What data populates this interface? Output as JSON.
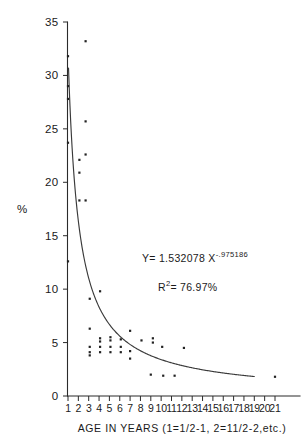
{
  "chart_data": {
    "type": "scatter",
    "title": "",
    "subtitle": "",
    "xlabel": "AGE IN YEARS (1=1/2-1, 2=11/2-2,etc.)",
    "ylabel": "%",
    "xlim": [
      0,
      21.8
    ],
    "ylim": [
      0,
      35
    ],
    "grid": false,
    "legend": false,
    "x_ticks": [
      1,
      2,
      3,
      4,
      5,
      6,
      7,
      8,
      9,
      10,
      11,
      12,
      13,
      14,
      15,
      16,
      17,
      18,
      19,
      20,
      21
    ],
    "x_tick_labels": [
      "1",
      "2",
      "3",
      "4",
      "5",
      "6",
      "7",
      "8",
      "9",
      "10",
      "11",
      "12",
      "13",
      "14",
      "15",
      "16",
      "17",
      "18",
      "19",
      "20",
      "21"
    ],
    "y_ticks": [
      0,
      5,
      10,
      15,
      20,
      25,
      30,
      35
    ],
    "y_tick_labels": [
      "0",
      "5",
      "10",
      "15",
      "20",
      "25",
      "30",
      "35"
    ],
    "annotations": [
      {
        "name": "regression-equation",
        "parts": {
          "lead": "Y= 1.532078 X",
          "exponent": "-.975186"
        },
        "x": 9.5,
        "y": 12.6
      },
      {
        "name": "r-squared",
        "parts": {
          "lead": "R",
          "exponent": "2",
          "tail": "= 76.97%"
        },
        "x": 11.0,
        "y": 10.0
      }
    ],
    "fit": {
      "name": "power-law-fit-curve",
      "equation": "Y = 1.532078 * X^(-0.975186)",
      "coefficient": 1.532078,
      "exponent": -0.975186,
      "r_squared_percent": 76.97,
      "x_start": 1.05,
      "x_end": 19.0
    },
    "points": [
      {
        "x": 1.0,
        "y": 31.8
      },
      {
        "x": 1.0,
        "y": 29.0
      },
      {
        "x": 1.0,
        "y": 27.8
      },
      {
        "x": 1.0,
        "y": 23.7
      },
      {
        "x": 1.0,
        "y": 12.6
      },
      {
        "x": 2.7,
        "y": 33.2
      },
      {
        "x": 2.7,
        "y": 25.7
      },
      {
        "x": 2.7,
        "y": 22.6
      },
      {
        "x": 2.1,
        "y": 22.1
      },
      {
        "x": 2.1,
        "y": 20.9
      },
      {
        "x": 2.1,
        "y": 18.3
      },
      {
        "x": 2.7,
        "y": 18.3
      },
      {
        "x": 3.1,
        "y": 9.1
      },
      {
        "x": 3.1,
        "y": 6.3
      },
      {
        "x": 3.1,
        "y": 4.6
      },
      {
        "x": 3.1,
        "y": 4.1
      },
      {
        "x": 3.1,
        "y": 3.8
      },
      {
        "x": 4.1,
        "y": 9.8
      },
      {
        "x": 4.1,
        "y": 5.4
      },
      {
        "x": 4.1,
        "y": 5.1
      },
      {
        "x": 4.1,
        "y": 4.6
      },
      {
        "x": 4.1,
        "y": 4.1
      },
      {
        "x": 5.1,
        "y": 5.5
      },
      {
        "x": 5.1,
        "y": 5.2
      },
      {
        "x": 5.1,
        "y": 4.6
      },
      {
        "x": 5.1,
        "y": 4.1
      },
      {
        "x": 6.1,
        "y": 5.3
      },
      {
        "x": 6.1,
        "y": 4.6
      },
      {
        "x": 6.1,
        "y": 4.1
      },
      {
        "x": 7.0,
        "y": 6.1
      },
      {
        "x": 7.0,
        "y": 4.2
      },
      {
        "x": 7.0,
        "y": 3.5
      },
      {
        "x": 8.1,
        "y": 5.2
      },
      {
        "x": 9.2,
        "y": 5.4
      },
      {
        "x": 9.2,
        "y": 5.0
      },
      {
        "x": 9.0,
        "y": 2.0
      },
      {
        "x": 10.1,
        "y": 4.6
      },
      {
        "x": 10.2,
        "y": 1.9
      },
      {
        "x": 11.3,
        "y": 1.9
      },
      {
        "x": 12.2,
        "y": 4.5
      },
      {
        "x": 21.0,
        "y": 1.8
      }
    ]
  }
}
